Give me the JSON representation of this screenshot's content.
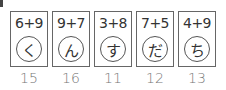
{
  "problems": [
    {
      "expression": "6+9",
      "kana": "く",
      "answer": "15"
    },
    {
      "expression": "9+7",
      "kana": "ん",
      "answer": "16"
    },
    {
      "expression": "3+8",
      "kana": "す",
      "answer": "11"
    },
    {
      "expression": "7+5",
      "kana": "だ",
      "answer": "12"
    },
    {
      "expression": "4+9",
      "kana": "ち",
      "answer": "13"
    }
  ]
}
